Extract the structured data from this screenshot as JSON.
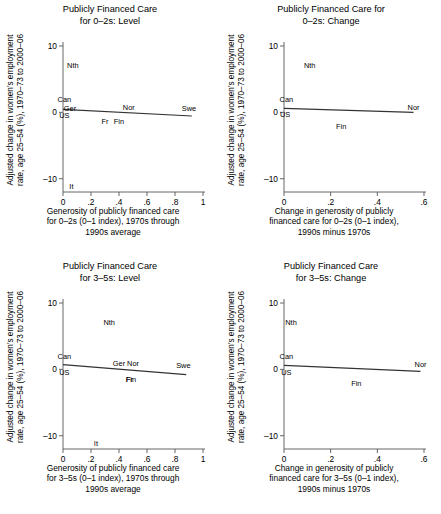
{
  "figure": {
    "width": 441,
    "height": 514,
    "background": "#ffffff",
    "axis_color": "#555555",
    "line_color": "#333333",
    "text_color": "#000000"
  },
  "chart_data": [
    {
      "id": "panel-top-left",
      "type": "scatter",
      "title": "Publicly Financed Care\nfor 0–2s: Level",
      "xlabel": "Generosity of publicly financed care\nfor 0–2s (0–1 index), 1970s through\n1990s average",
      "ylabel": "Adjusted change in women's employment\nrate, age 25–54 (%), 1970–73 to 2000–06",
      "xlim": [
        0,
        1
      ],
      "ylim": [
        -12,
        10
      ],
      "xticks": [
        0,
        0.2,
        0.4,
        0.6,
        0.8,
        1
      ],
      "xticklabels": [
        "0",
        ".2",
        ".4",
        ".6",
        ".8",
        "1"
      ],
      "yticks": [
        -10,
        0,
        10
      ],
      "yticklabels": [
        "–10",
        "0",
        "10"
      ],
      "grid": false,
      "legend": "none",
      "points": [
        {
          "label": "Nth",
          "x": 0.07,
          "y": 7.0
        },
        {
          "label": "Can",
          "x": 0.01,
          "y": 1.9
        },
        {
          "label": "Ger",
          "x": 0.05,
          "y": 0.5
        },
        {
          "label": "US",
          "x": 0.01,
          "y": -0.5
        },
        {
          "label": "Fr",
          "x": 0.3,
          "y": -1.4
        },
        {
          "label": "Fin",
          "x": 0.4,
          "y": -1.5
        },
        {
          "label": "Nor",
          "x": 0.47,
          "y": 0.7
        },
        {
          "label": "Swe",
          "x": 0.9,
          "y": 0.5
        },
        {
          "label": "It",
          "x": 0.06,
          "y": -11.3
        }
      ],
      "fit_line": {
        "x0": 0.0,
        "y0": 0.45,
        "x1": 0.92,
        "y1": -0.55
      }
    },
    {
      "id": "panel-top-right",
      "type": "scatter",
      "title": "Publicly Financed Care for\n0–2s: Change",
      "xlabel": "Change in generosity of publicly\nfinanced  care for 0–2s (0–1 index),\n1990s minus 1970s",
      "ylabel": "Adjusted change in women's employment\nrate, age 25–54 (%), 1970–73 to 2000–06",
      "xlim": [
        0,
        0.6
      ],
      "ylim": [
        -12,
        10
      ],
      "xticks": [
        0,
        0.2,
        0.4,
        0.6
      ],
      "xticklabels": [
        "0",
        ".2",
        ".4",
        ".6"
      ],
      "yticks": [
        -10,
        0,
        10
      ],
      "yticklabels": [
        "–10",
        "0",
        "10"
      ],
      "grid": false,
      "legend": "none",
      "points": [
        {
          "label": "Nth",
          "x": 0.11,
          "y": 7.0
        },
        {
          "label": "Can",
          "x": 0.01,
          "y": 1.9
        },
        {
          "label": "US",
          "x": 0.005,
          "y": -0.4
        },
        {
          "label": "Fin",
          "x": 0.245,
          "y": -2.2
        },
        {
          "label": "Nor",
          "x": 0.555,
          "y": 0.6
        }
      ],
      "fit_line": {
        "x0": 0.0,
        "y0": 0.6,
        "x1": 0.555,
        "y1": 0.0
      }
    },
    {
      "id": "panel-bottom-left",
      "type": "scatter",
      "title": "Publicly Financed Care\nfor 3–5s: Level",
      "xlabel": "Generosity of publicly financed care\nfor 3–5s (0–1 index), 1970s through\n1990s average",
      "ylabel": "Adjusted change in women's employment\nrate, age 25–54 (%), 1970–73 to 2000–06",
      "xlim": [
        0,
        1
      ],
      "ylim": [
        -12,
        10
      ],
      "xticks": [
        0,
        0.2,
        0.4,
        0.6,
        0.8,
        1
      ],
      "xticklabels": [
        "0",
        ".2",
        ".4",
        ".6",
        ".8",
        "1"
      ],
      "yticks": [
        -10,
        0,
        10
      ],
      "yticklabels": [
        "–10",
        "0",
        "10"
      ],
      "grid": false,
      "legend": "none",
      "points": [
        {
          "label": "Nth",
          "x": 0.33,
          "y": 7.0
        },
        {
          "label": "Can",
          "x": 0.01,
          "y": 1.9
        },
        {
          "label": "Ger",
          "x": 0.4,
          "y": 0.8
        },
        {
          "label": "Nor",
          "x": 0.5,
          "y": 0.8
        },
        {
          "label": "US",
          "x": 0.01,
          "y": -0.5
        },
        {
          "label": "Fr",
          "x": 0.475,
          "y": -1.6
        },
        {
          "label": "Fin",
          "x": 0.485,
          "y": -1.6
        },
        {
          "label": "Swe",
          "x": 0.86,
          "y": 0.5
        },
        {
          "label": "It",
          "x": 0.235,
          "y": -11.2
        }
      ],
      "fit_line": {
        "x0": 0.0,
        "y0": 0.7,
        "x1": 0.88,
        "y1": -0.8
      }
    },
    {
      "id": "panel-bottom-right",
      "type": "scatter",
      "title": "Publicly Financed Care\nfor 3–5s: Change",
      "xlabel": "Change in generosity of publicly\nfinanced care for 3–5s (0–1 index),\n1990s minus 1970s",
      "ylabel": "Adjusted change in women's employment\nrate, age 25–54 (%), 1970–73 to 2000–06",
      "xlim": [
        0,
        0.6
      ],
      "ylim": [
        -12,
        10
      ],
      "xticks": [
        0,
        0.2,
        0.4,
        0.6
      ],
      "xticklabels": [
        "0",
        ".2",
        ".4",
        ".6"
      ],
      "yticks": [
        -10,
        0,
        10
      ],
      "yticklabels": [
        "–10",
        "0",
        "10"
      ],
      "grid": false,
      "legend": "none",
      "points": [
        {
          "label": "Nth",
          "x": 0.03,
          "y": 7.0
        },
        {
          "label": "Can",
          "x": 0.01,
          "y": 1.9
        },
        {
          "label": "US",
          "x": 0.01,
          "y": -0.6
        },
        {
          "label": "Fin",
          "x": 0.31,
          "y": -2.2
        },
        {
          "label": "Nor",
          "x": 0.585,
          "y": 0.6
        }
      ],
      "fit_line": {
        "x0": 0.0,
        "y0": 0.6,
        "x1": 0.585,
        "y1": -0.3
      }
    }
  ]
}
